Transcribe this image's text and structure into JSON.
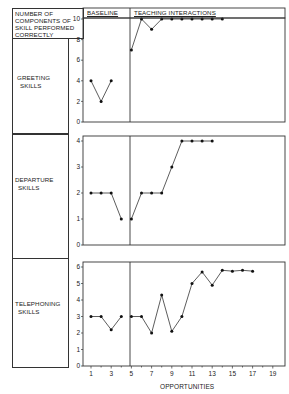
{
  "header": {
    "ylabel_lines": [
      "NUMBER OF",
      "COMPONENTS OF",
      "SKILL PERFORMED",
      "CORRECTLY"
    ],
    "phase_baseline": "BASELINE",
    "phase_teaching": "TEACHING INTERACTIONS"
  },
  "panels": [
    {
      "label_lines": [
        "GREETING",
        "SKILLS"
      ]
    },
    {
      "label_lines": [
        "DEPARTURE",
        "SKILLS"
      ]
    },
    {
      "label_lines": [
        "TELEPHONING",
        "SKILLS"
      ]
    }
  ],
  "xaxis": {
    "label": "OPPORTUNITIES",
    "ticks": [
      "1",
      "3",
      "5",
      "7",
      "9",
      "11",
      "13",
      "15",
      "17",
      "19"
    ]
  },
  "chart_data": [
    {
      "type": "line",
      "title": "Greeting Skills",
      "xlabel": "Opportunities",
      "ylabel": "Number of components of skill performed correctly",
      "ylim": [
        0,
        10
      ],
      "yticks": [
        0,
        2,
        4,
        6,
        8,
        10
      ],
      "phase_change_after_x": 4.5,
      "series": [
        {
          "name": "Baseline",
          "x": [
            1,
            2,
            3
          ],
          "values": [
            4,
            2,
            4
          ]
        },
        {
          "name": "Teaching Interactions",
          "x": [
            5,
            6,
            7,
            8,
            9,
            10,
            11,
            12,
            13,
            14
          ],
          "values": [
            7,
            10,
            9,
            10,
            10,
            10,
            10,
            10,
            10,
            10
          ]
        }
      ]
    },
    {
      "type": "line",
      "title": "Departure Skills",
      "xlabel": "Opportunities",
      "ylabel": "Number of components of skill performed correctly",
      "ylim": [
        0,
        4
      ],
      "yticks": [
        0,
        1,
        2,
        3,
        4
      ],
      "phase_change_after_x": 4.5,
      "series": [
        {
          "name": "Baseline",
          "x": [
            1,
            2,
            3,
            4
          ],
          "values": [
            2,
            2,
            2,
            1
          ]
        },
        {
          "name": "Teaching Interactions",
          "x": [
            5,
            6,
            7,
            8,
            9,
            10,
            11,
            12,
            13
          ],
          "values": [
            1,
            2,
            2,
            2,
            3,
            4,
            4,
            4,
            4
          ]
        }
      ]
    },
    {
      "type": "line",
      "title": "Telephoning Skills",
      "xlabel": "Opportunities",
      "ylabel": "Number of components of skill performed correctly",
      "ylim": [
        0,
        6
      ],
      "yticks": [
        0,
        1,
        2,
        3,
        4,
        5,
        6
      ],
      "phase_change_after_x": 4.5,
      "series": [
        {
          "name": "Baseline",
          "x": [
            1,
            2,
            3,
            4
          ],
          "values": [
            3,
            3,
            2.2,
            3
          ]
        },
        {
          "name": "Teaching Interactions",
          "x": [
            5,
            6,
            7,
            8,
            9,
            10,
            11,
            12,
            13,
            14,
            15,
            16,
            17
          ],
          "values": [
            3,
            3,
            2,
            4.3,
            2.1,
            3,
            5,
            5.7,
            4.9,
            5.8,
            5.75,
            5.8,
            5.75
          ]
        }
      ]
    }
  ]
}
